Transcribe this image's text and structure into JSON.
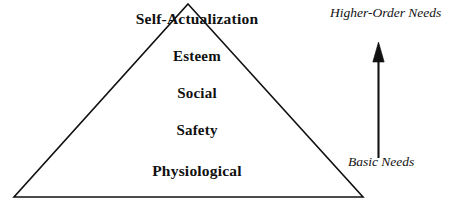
{
  "diagram": {
    "type": "pyramid",
    "background_color": "#ffffff",
    "stroke_color": "#111111",
    "text_color": "#111111",
    "tiers": [
      {
        "id": "self-actualization",
        "label": "Self-Actualization",
        "level": 5
      },
      {
        "id": "esteem",
        "label": "Esteem",
        "level": 4
      },
      {
        "id": "social",
        "label": "Social",
        "level": 3
      },
      {
        "id": "safety",
        "label": "Safety",
        "level": 2
      },
      {
        "id": "physiological",
        "label": "Physiological",
        "level": 1
      }
    ],
    "annotations": {
      "top_label": "Higher-Order Needs",
      "bottom_label": "Basic Needs",
      "arrow_direction": "up"
    },
    "geometry": {
      "apex": "188,4",
      "left_corner": "14,197",
      "right_corner": "363,197",
      "arrow_x": "378",
      "arrow_top_y": "43",
      "arrow_bottom_y": "158"
    }
  }
}
